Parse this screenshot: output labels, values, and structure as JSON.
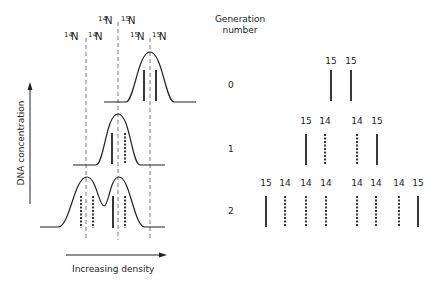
{
  "left_panel": {
    "y_axis_label": "DNA concentration",
    "x_axis_label": "Increasing density",
    "header_top": [
      {
        "iso": "14",
        "el": "N"
      },
      {
        "iso": "15",
        "el": "N"
      }
    ],
    "header_bottom": [
      {
        "iso": "14",
        "el": "N"
      },
      {
        "iso": "14",
        "el": "N"
      },
      {
        "iso": "15",
        "el": "N"
      },
      {
        "iso": "15",
        "el": "N"
      }
    ]
  },
  "right_panel": {
    "header_line1": "Generation",
    "header_line2": "number",
    "generations": [
      {
        "number": "0",
        "bands": [
          {
            "label": "15",
            "style": "solid"
          },
          {
            "label": "15",
            "style": "solid"
          }
        ]
      },
      {
        "number": "1",
        "bands": [
          {
            "label": "15",
            "style": "solid"
          },
          {
            "label": "14",
            "style": "dashed"
          },
          {
            "label": "14",
            "style": "dashed"
          },
          {
            "label": "15",
            "style": "solid"
          }
        ]
      },
      {
        "number": "2",
        "bands": [
          {
            "label": "15",
            "style": "solid"
          },
          {
            "label": "14",
            "style": "dashed"
          },
          {
            "label": "14",
            "style": "dashed"
          },
          {
            "label": "14",
            "style": "dashed"
          },
          {
            "label": "14",
            "style": "dashed"
          },
          {
            "label": "14",
            "style": "dashed"
          },
          {
            "label": "14",
            "style": "dashed"
          },
          {
            "label": "15",
            "style": "solid"
          }
        ]
      }
    ]
  }
}
